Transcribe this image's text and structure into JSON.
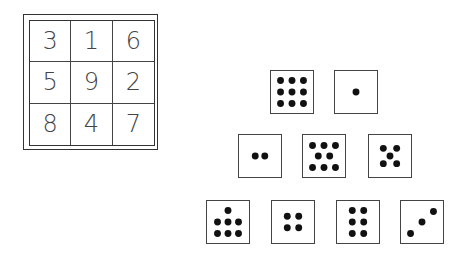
{
  "magic_square": {
    "rows": [
      [
        "3",
        "1",
        "6"
      ],
      [
        "5",
        "9",
        "2"
      ],
      [
        "8",
        "4",
        "7"
      ]
    ]
  },
  "dice": {
    "rows": [
      [
        9,
        1
      ],
      [
        2,
        8,
        5
      ],
      [
        7,
        4,
        6,
        3
      ]
    ]
  }
}
